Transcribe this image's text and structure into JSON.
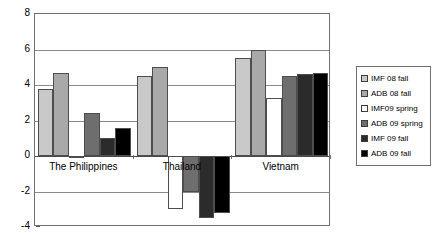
{
  "chart_data": {
    "type": "bar",
    "title": "",
    "subtitle": "",
    "xlabel": "",
    "ylabel": "",
    "categories": [
      "The Philippines",
      "Thailand",
      "Vietnam"
    ],
    "ylim": [
      -4,
      8
    ],
    "yticks": [
      8,
      6,
      4,
      2,
      0,
      -2,
      -4
    ],
    "ytick_labels": [
      "8",
      "6",
      "4",
      "2",
      "0",
      "-2",
      "-4"
    ],
    "grid": true,
    "grid_axis": "y",
    "legend_position": "right",
    "series": [
      {
        "name": "IMF 08 fall",
        "color": "#c9c9c9",
        "values": [
          3.8,
          4.5,
          5.5
        ]
      },
      {
        "name": "ADB 08 fall",
        "color": "#a9a9a9",
        "values": [
          4.7,
          5.0,
          6.0
        ]
      },
      {
        "name": "IMF09 spring",
        "color": "#ffffff",
        "values": [
          0.0,
          -3.0,
          3.25
        ]
      },
      {
        "name": "ADB 09 spring",
        "color": "#6e6e6e",
        "values": [
          2.45,
          -2.0,
          4.5
        ]
      },
      {
        "name": "IMF 09 fall",
        "color": "#2b2b2b",
        "values": [
          1.0,
          -3.5,
          4.6
        ]
      },
      {
        "name": "ADB 09 fall",
        "color": "#000000",
        "values": [
          1.6,
          -3.2,
          4.7
        ]
      }
    ]
  },
  "legend": {
    "items": [
      {
        "label": "IMF 08 fall"
      },
      {
        "label": "ADB 08 fall"
      },
      {
        "label": "IMF09 spring"
      },
      {
        "label": "ADB 09 spring"
      },
      {
        "label": "IMF 09 fall"
      },
      {
        "label": "ADB 09 fall"
      }
    ]
  }
}
